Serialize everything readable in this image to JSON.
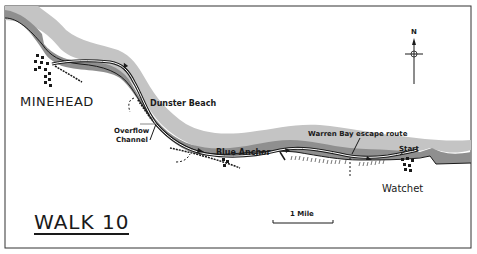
{
  "map": {
    "title": "WALK 10",
    "places": {
      "minehead": "MINEHEAD",
      "dunster_beach": "Dunster Beach",
      "overflow_channel_line1": "Overflow",
      "overflow_channel_line2": "Channel",
      "blue_anchor": "Blue Anchor",
      "warren_bay": "Warren Bay escape route",
      "start": "Start",
      "watchet": "Watchet"
    },
    "scale": {
      "label": "1 Mile"
    },
    "compass": {
      "label": "N"
    },
    "colors": {
      "sea_dark": "#8f8f8f",
      "sea_light": "#c4c4c4",
      "ink": "#1a1a1a",
      "paper": "#ffffff"
    }
  }
}
